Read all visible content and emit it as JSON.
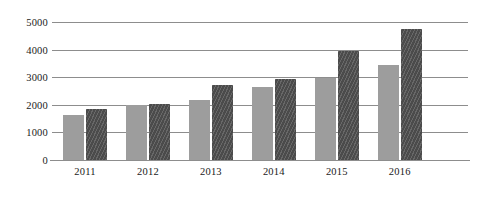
{
  "chart_data": {
    "type": "bar",
    "title": "",
    "subtitle": "",
    "xlabel": "",
    "ylabel": "",
    "categories": [
      "2011",
      "2012",
      "2013",
      "2014",
      "2015",
      "2016"
    ],
    "series": [
      {
        "name": "series-1",
        "color": "#9d9d9d",
        "pattern": "solid",
        "values": [
          1620,
          1980,
          2170,
          2650,
          2980,
          3450
        ]
      },
      {
        "name": "series-2",
        "color": "#4b4b4b",
        "pattern": "diagonal-hatch",
        "values": [
          1860,
          2020,
          2700,
          2950,
          3950,
          4760
        ]
      }
    ],
    "ylim": [
      0,
      5000
    ],
    "y_ticks": [
      0,
      1000,
      2000,
      3000,
      4000,
      5000
    ],
    "y_tick_labels": [
      "0",
      "1000",
      "2000",
      "3000",
      "4000",
      "5000"
    ],
    "grid": true,
    "grid_axis": "y",
    "legend": false,
    "legend_position": "none",
    "annotations": []
  },
  "colors": {
    "background": "#ffffff",
    "grid": "#8d8d8d",
    "axis": "#8d8d8d",
    "text": "#1a1a1a",
    "series_1": "#9d9d9d",
    "series_2": "#4b4b4b"
  }
}
